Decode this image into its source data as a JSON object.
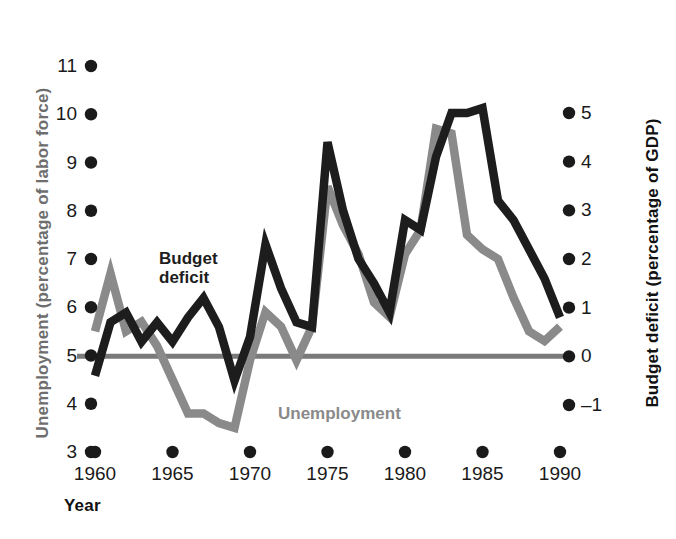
{
  "chart_data": {
    "type": "line",
    "title": "",
    "xlabel": "Year",
    "axes": {
      "x": {
        "label": "Year",
        "ticks": [
          1960,
          1965,
          1970,
          1975,
          1980,
          1985,
          1990
        ],
        "tick_labels": [
          "1960",
          "1965",
          "1970",
          "1975",
          "1980",
          "1985",
          "1990"
        ],
        "range": [
          1960,
          1990
        ]
      },
      "y_left": {
        "label": "Unemployment (percentage of labor force)",
        "ticks": [
          3,
          4,
          5,
          6,
          7,
          8,
          9,
          10,
          11
        ],
        "tick_labels": [
          "3",
          "4",
          "5",
          "6",
          "7",
          "8",
          "9",
          "10",
          "11"
        ],
        "range": [
          3,
          11
        ],
        "color": "#8a8a8a"
      },
      "y_right": {
        "label": "Budget deficit (percentage of GDP)",
        "ticks": [
          -1,
          0,
          1,
          2,
          3,
          4,
          5
        ],
        "tick_labels": [
          "–1",
          "0",
          "1",
          "2",
          "3",
          "4",
          "5"
        ],
        "range": [
          -1,
          5
        ],
        "color": "#1a1a1a"
      }
    },
    "grid": false,
    "legend": {
      "position": "in-plot",
      "entries": [
        {
          "name": "Budget deficit",
          "label": "Budget\ndeficit",
          "color": "#1d1d1d",
          "axis": "y_right"
        },
        {
          "name": "Unemployment",
          "label": "Unemployment",
          "color": "#8a8a8a",
          "axis": "y_left"
        }
      ]
    },
    "zero_line": {
      "value": 0,
      "axis": "y_right",
      "color": "#7a7a7a"
    },
    "x": [
      1960,
      1961,
      1962,
      1963,
      1964,
      1965,
      1966,
      1967,
      1968,
      1969,
      1970,
      1971,
      1972,
      1973,
      1974,
      1975,
      1976,
      1977,
      1978,
      1979,
      1980,
      1981,
      1982,
      1983,
      1984,
      1985,
      1986,
      1987,
      1988,
      1989,
      1990
    ],
    "series": [
      {
        "name": "Unemployment",
        "axis": "y_left",
        "color": "#8a8a8a",
        "units": "percentage of labor force",
        "values": [
          5.5,
          6.7,
          5.5,
          5.7,
          5.2,
          4.5,
          3.8,
          3.8,
          3.6,
          3.5,
          4.9,
          5.9,
          5.6,
          4.9,
          5.6,
          8.5,
          7.7,
          7.1,
          6.1,
          5.8,
          7.1,
          7.6,
          9.7,
          9.6,
          7.5,
          7.2,
          7.0,
          6.2,
          5.5,
          5.3,
          5.6
        ],
        "peak": {
          "year": 1982,
          "value": 9.7
        },
        "min": {
          "year": 1969,
          "value": 3.5
        }
      },
      {
        "name": "Budget deficit",
        "axis": "y_right",
        "color": "#1d1d1d",
        "units": "percentage of GDP",
        "values": [
          -0.4,
          0.7,
          0.9,
          0.3,
          0.7,
          0.3,
          0.8,
          1.2,
          0.6,
          -0.5,
          0.4,
          2.3,
          1.4,
          0.7,
          0.6,
          4.4,
          3.0,
          2.0,
          1.5,
          0.9,
          2.8,
          2.6,
          4.1,
          5.0,
          5.0,
          5.1,
          3.2,
          2.8,
          2.2,
          1.6,
          0.8
        ],
        "peak": {
          "year": 1985,
          "value": 5.1
        },
        "min": {
          "year": 1969,
          "value": -0.5
        }
      }
    ]
  },
  "labels": {
    "budget_deficit": "Budget\ndeficit",
    "unemployment": "Unemployment",
    "year": "Year",
    "y_left_title": "Unemployment (percentage of labor force)",
    "y_right_title": "Budget deficit (percentage of GDP)"
  }
}
